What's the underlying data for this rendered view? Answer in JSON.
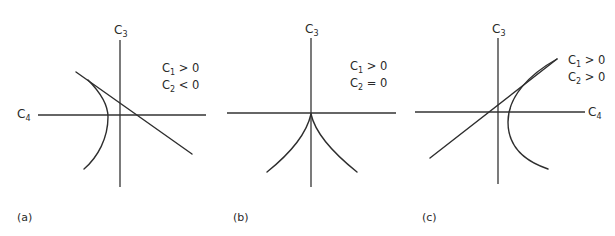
{
  "figure": {
    "panels": [
      {
        "id": "a",
        "label": "(a)",
        "vertical_axis": {
          "name": "C",
          "sub": "3"
        },
        "horizontal_axis": {
          "name": "C",
          "sub": "4"
        },
        "conditions": [
          {
            "name": "C",
            "sub": "1",
            "rel": " > 0"
          },
          {
            "name": "C",
            "sub": "2",
            "rel": " < 0"
          }
        ],
        "description": "Straight line tangent to a left-opening curved branch; both cross the C4 axis"
      },
      {
        "id": "b",
        "label": "(b)",
        "vertical_axis": {
          "name": "C",
          "sub": "3"
        },
        "horizontal_axis": {
          "name": "",
          "sub": ""
        },
        "conditions": [
          {
            "name": "C",
            "sub": "1",
            "rel": " > 0"
          },
          {
            "name": "C",
            "sub": "2",
            "rel": " = 0"
          }
        ],
        "description": "Cusp at the origin with two symmetric branches curving downward"
      },
      {
        "id": "c",
        "label": "(c)",
        "vertical_axis": {
          "name": "C",
          "sub": "3"
        },
        "horizontal_axis": {
          "name": "C",
          "sub": "4"
        },
        "conditions": [
          {
            "name": "C",
            "sub": "1",
            "rel": " > 0"
          },
          {
            "name": "C",
            "sub": "2",
            "rel": " > 0"
          }
        ],
        "description": "Straight line tangent to a right-opening curved branch meeting at upper right"
      }
    ]
  }
}
